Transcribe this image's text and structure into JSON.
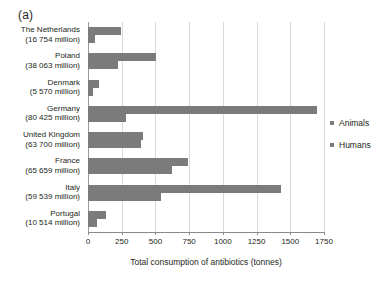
{
  "panel_label": "(a)",
  "legend": {
    "position": "right",
    "items": [
      {
        "label": "Animals",
        "color": "#7b7b7b"
      },
      {
        "label": "Humans",
        "color": "#7b7b7b"
      }
    ]
  },
  "axis": {
    "x_title": "Total consumption of antibiotics (tonnes)",
    "x_ticks": [
      "0",
      "250",
      "500",
      "750",
      "1000",
      "1250",
      "1500",
      "1750"
    ]
  },
  "chart_data": {
    "type": "bar",
    "orientation": "horizontal",
    "title": "(a)",
    "xlabel": "Total consumption of antibiotics (tonnes)",
    "ylabel": "",
    "xlim": [
      0,
      1750
    ],
    "xticks": [
      0,
      250,
      500,
      750,
      1000,
      1250,
      1500,
      1750
    ],
    "grid": true,
    "legend_position": "right",
    "bar_color": "#7b7b7b",
    "categories": [
      "The Netherlands",
      "Poland",
      "Denmark",
      "Germany",
      "United Kingdom",
      "France",
      "Italy",
      "Portugal"
    ],
    "category_populations": [
      "(16 754 million)",
      "(38 063 million)",
      "(5 570 million)",
      "(80 425 million)",
      "(63 700 million)",
      "(65 659 million)",
      "(59 539 million)",
      "(10 514 million)"
    ],
    "series": [
      {
        "name": "Animals",
        "color": "#7b7b7b",
        "values": [
          245,
          505,
          80,
          1700,
          410,
          740,
          1430,
          130
        ]
      },
      {
        "name": "Humans",
        "color": "#7b7b7b",
        "values": [
          55,
          225,
          40,
          285,
          390,
          620,
          545,
          70
        ]
      }
    ]
  }
}
